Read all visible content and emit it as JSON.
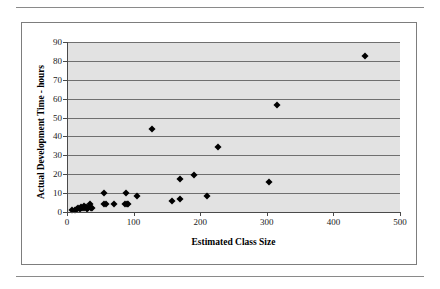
{
  "figure": {
    "border_color": "#7d7d7d",
    "rule_color": "#8a8a8a"
  },
  "chart_data": {
    "type": "scatter",
    "title": "",
    "xlabel": "Estimated Class Size",
    "ylabel": "Actual Development Time - hours",
    "xlim": [
      0,
      500
    ],
    "ylim": [
      0,
      90
    ],
    "xticks": [
      0,
      100,
      200,
      300,
      400,
      500
    ],
    "yticks": [
      0,
      10,
      20,
      30,
      40,
      50,
      60,
      70,
      80,
      90
    ],
    "xtick_labels": [
      "0",
      "100",
      "200",
      "300",
      "400",
      "500"
    ],
    "ytick_labels": [
      "0",
      "10",
      "20",
      "30",
      "40",
      "50",
      "60",
      "70",
      "80",
      "90"
    ],
    "grid": "horizontal",
    "plot_background": "#e2e2e2",
    "gridline_color": "#6f6f6f",
    "marker": "diamond",
    "marker_color": "#000000",
    "legend": "none",
    "points": [
      [
        8,
        1
      ],
      [
        12,
        1
      ],
      [
        15,
        1.5
      ],
      [
        17,
        2
      ],
      [
        19,
        1.5
      ],
      [
        21,
        2.5
      ],
      [
        23,
        2
      ],
      [
        25,
        3
      ],
      [
        26,
        2
      ],
      [
        28,
        2.5
      ],
      [
        30,
        1.8
      ],
      [
        32,
        2
      ],
      [
        34,
        4
      ],
      [
        36,
        2
      ],
      [
        38,
        2
      ],
      [
        55,
        10
      ],
      [
        56,
        4
      ],
      [
        58,
        4
      ],
      [
        70,
        4
      ],
      [
        88,
        10
      ],
      [
        87,
        4.5
      ],
      [
        90,
        4
      ],
      [
        92,
        4
      ],
      [
        105,
        8.5
      ],
      [
        127,
        44
      ],
      [
        157,
        6
      ],
      [
        169,
        17.5
      ],
      [
        170,
        6.8
      ],
      [
        191,
        19.5
      ],
      [
        210,
        8.5
      ],
      [
        227,
        34.5
      ],
      [
        303,
        15.8
      ],
      [
        315,
        56.5
      ],
      [
        447,
        82.5
      ]
    ]
  }
}
